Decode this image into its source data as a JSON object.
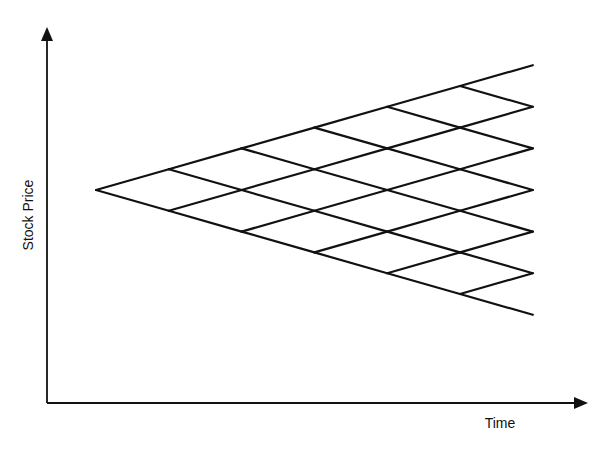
{
  "diagram": {
    "type": "binomial-tree",
    "steps": 6,
    "x_axis_label": "Time",
    "y_axis_label": "Stock Price",
    "line_color": "#111111",
    "geometry": {
      "root": [
        96,
        190
      ],
      "step_dx": 72.8,
      "half_step_dy": 20.8,
      "axis_origin": [
        47,
        403
      ],
      "y_axis_top": 27,
      "x_axis_right": 588
    }
  }
}
